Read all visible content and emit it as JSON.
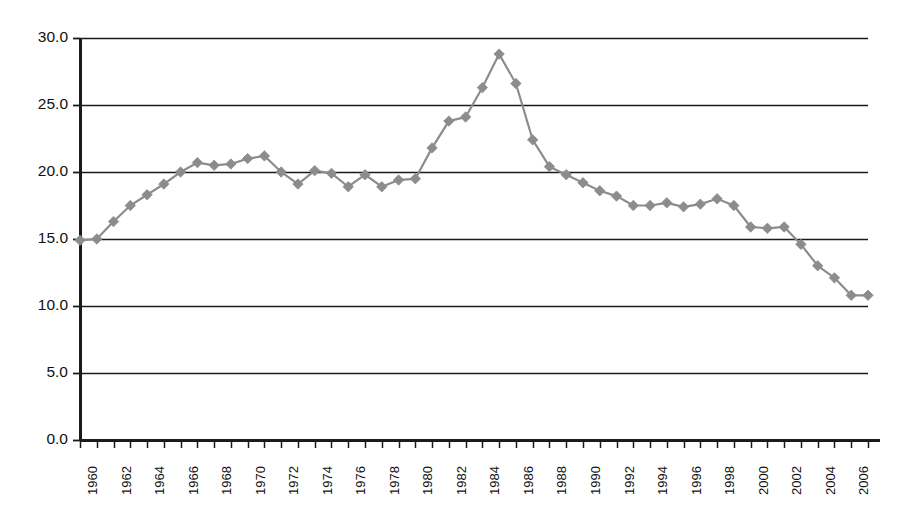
{
  "chart_data": {
    "type": "line",
    "title": "",
    "subtitle": "",
    "xlabel": "",
    "ylabel": "",
    "xlim": [
      1960,
      2007
    ],
    "ylim": [
      0.0,
      30.0
    ],
    "grid": true,
    "grid_axis": "y",
    "legend": false,
    "legend_position": "none",
    "marker": "diamond",
    "series_color": "#8c8c8c",
    "axis_color": "#1a1a1a",
    "y_ticks": [
      0.0,
      5.0,
      10.0,
      15.0,
      20.0,
      25.0,
      30.0
    ],
    "y_tick_labels": [
      "0.0",
      "5.0",
      "10.0",
      "15.0",
      "20.0",
      "25.0",
      "30.0"
    ],
    "x_ticks": [
      1960,
      1961,
      1962,
      1963,
      1964,
      1965,
      1966,
      1967,
      1968,
      1969,
      1970,
      1971,
      1972,
      1973,
      1974,
      1975,
      1976,
      1977,
      1978,
      1979,
      1980,
      1981,
      1982,
      1983,
      1984,
      1985,
      1986,
      1987,
      1988,
      1989,
      1990,
      1991,
      1992,
      1993,
      1994,
      1995,
      1996,
      1997,
      1998,
      1999,
      2000,
      2001,
      2002,
      2003,
      2004,
      2005,
      2006,
      2007
    ],
    "x_tick_labels": [
      "1960",
      "1962",
      "1964",
      "1966",
      "1968",
      "1970",
      "1972",
      "1974",
      "1976",
      "1978",
      "1980",
      "1982",
      "1984",
      "1986",
      "1988",
      "1990",
      "1992",
      "1994",
      "1996",
      "1998",
      "2000",
      "2002",
      "2004",
      "2006"
    ],
    "x_tick_label_years": [
      1960,
      1962,
      1964,
      1966,
      1968,
      1970,
      1972,
      1974,
      1976,
      1978,
      1980,
      1982,
      1984,
      1986,
      1988,
      1990,
      1992,
      1994,
      1996,
      1998,
      2000,
      2002,
      2004,
      2006
    ],
    "x": [
      1960,
      1961,
      1962,
      1963,
      1964,
      1965,
      1966,
      1967,
      1968,
      1969,
      1970,
      1971,
      1972,
      1973,
      1974,
      1975,
      1976,
      1977,
      1978,
      1979,
      1980,
      1981,
      1982,
      1983,
      1984,
      1985,
      1986,
      1987,
      1988,
      1989,
      1990,
      1991,
      1992,
      1993,
      1994,
      1995,
      1996,
      1997,
      1998,
      1999,
      2000,
      2001,
      2002,
      2003,
      2004,
      2005,
      2006,
      2007
    ],
    "values": [
      14.9,
      15.0,
      16.3,
      17.5,
      18.3,
      19.1,
      20.0,
      20.7,
      20.5,
      20.6,
      21.0,
      21.2,
      20.0,
      19.1,
      20.1,
      19.9,
      18.9,
      19.8,
      18.9,
      19.4,
      19.5,
      21.8,
      23.8,
      24.1,
      26.3,
      28.8,
      26.6,
      22.4,
      20.4,
      19.8,
      19.2,
      18.6,
      18.2,
      17.5,
      17.5,
      17.7,
      17.4,
      17.6,
      18.0,
      17.5,
      15.9,
      15.8,
      15.9,
      14.6,
      13.0,
      12.1,
      10.8,
      10.8
    ],
    "series": [
      {
        "name": "series-1",
        "values": [
          14.9,
          15.0,
          16.3,
          17.5,
          18.3,
          19.1,
          20.0,
          20.7,
          20.5,
          20.6,
          21.0,
          21.2,
          20.0,
          19.1,
          20.1,
          19.9,
          18.9,
          19.8,
          18.9,
          19.4,
          19.5,
          21.8,
          23.8,
          24.1,
          26.3,
          28.8,
          26.6,
          22.4,
          20.4,
          19.8,
          19.2,
          18.6,
          18.2,
          17.5,
          17.5,
          17.7,
          17.4,
          17.6,
          18.0,
          17.5,
          15.9,
          15.8,
          15.9,
          14.6,
          13.0,
          12.1,
          10.8,
          10.8
        ]
      }
    ]
  }
}
